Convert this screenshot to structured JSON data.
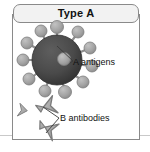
{
  "panel": {
    "title": "Type A",
    "title_box_name": "type-a-title-box"
  },
  "labels": {
    "antigens": "A antigens",
    "antibodies": "B antibodies"
  },
  "colors": {
    "cell_body": "#4a4a4a",
    "cell_body_shadow": "#3a3a3a",
    "antigen": "#a3a3a3",
    "antigen_stroke": "#7d7d7d",
    "antibody": "#a8a8a8",
    "antibody_stroke": "#7a7a7a",
    "leader_line": "#3a3a3a",
    "panel_border": "#8a8a8a",
    "title_fill": "#f2f2f2",
    "page_rule": "#c9c9c9",
    "text": "#111111",
    "background": "#ffffff"
  },
  "diagram": {
    "type": "blood-type-antigen-antibody-illustration",
    "blood_type": "A",
    "cell": {
      "name": "red-blood-cell",
      "cx": 45,
      "cy": 46,
      "r": 25
    },
    "antigen_count": 12,
    "antigens": [
      {
        "cx": 45,
        "cy": 13,
        "r": 6.5,
        "stalk_to_cx": 45,
        "stalk_to_cy": 40
      },
      {
        "cx": 66,
        "cy": 18,
        "r": 6.0,
        "stalk_to_cx": 50,
        "stalk_to_cy": 40
      },
      {
        "cx": 78,
        "cy": 34,
        "r": 6.0,
        "stalk_to_cx": 56,
        "stalk_to_cy": 43
      },
      {
        "cx": 80,
        "cy": 52,
        "r": 6.0,
        "stalk_to_cx": 57,
        "stalk_to_cy": 49
      },
      {
        "cx": 71,
        "cy": 68,
        "r": 6.0,
        "stalk_to_cx": 54,
        "stalk_to_cy": 56
      },
      {
        "cx": 53,
        "cy": 78,
        "r": 6.5,
        "stalk_to_cx": 47,
        "stalk_to_cy": 58
      },
      {
        "cx": 33,
        "cy": 77,
        "r": 6.0,
        "stalk_to_cx": 38,
        "stalk_to_cy": 58
      },
      {
        "cx": 17,
        "cy": 65,
        "r": 6.0,
        "stalk_to_cx": 32,
        "stalk_to_cy": 54
      },
      {
        "cx": 11,
        "cy": 46,
        "r": 6.0,
        "stalk_to_cx": 30,
        "stalk_to_cy": 46
      },
      {
        "cx": 15,
        "cy": 29,
        "r": 6.0,
        "stalk_to_cx": 32,
        "stalk_to_cy": 39
      },
      {
        "cx": 29,
        "cy": 17,
        "r": 6.0,
        "stalk_to_cx": 38,
        "stalk_to_cy": 37
      },
      {
        "cx": 52,
        "cy": 45,
        "r": 6.5,
        "stalk_to_cx": 45,
        "stalk_to_cy": 46
      }
    ],
    "antibody_count": 3,
    "antibodies": [
      {
        "name": "b-antibody-small",
        "cx": 13,
        "cy": 97,
        "scale": 0.72,
        "rotate": 12
      },
      {
        "name": "b-antibody-upper",
        "cx": 35,
        "cy": 94,
        "scale": 1.0,
        "rotate": -18
      },
      {
        "name": "b-antibody-lower",
        "cx": 35,
        "cy": 116,
        "scale": 1.0,
        "rotate": 22
      }
    ],
    "leaders": {
      "antigens": [
        {
          "from_x": 58,
          "from_y": 49,
          "to_x": 60,
          "to_y": 47
        },
        {
          "from_x": 45,
          "from_y": 31,
          "to_x": 60,
          "to_y": 47
        }
      ],
      "antibodies": [
        {
          "from_x": 30,
          "from_y": 95,
          "to_x": 47,
          "to_y": 104
        },
        {
          "from_x": 33,
          "from_y": 118,
          "to_x": 47,
          "to_y": 104
        }
      ]
    }
  }
}
